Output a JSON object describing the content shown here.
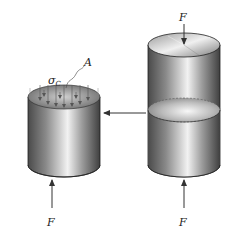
{
  "figure": {
    "labels": {
      "force_top": "F",
      "force_bottom_left": "F",
      "force_bottom_right": "F",
      "stress": "σ",
      "stress_subscript": "C",
      "area": "A"
    },
    "colors": {
      "background": "#ffffff",
      "metal_dark": "#5a5a5a",
      "metal_mid": "#9a9a9a",
      "metal_light": "#e6e6e6",
      "arrow": "#333333",
      "outline": "#222222"
    },
    "elements": [
      "left-cylinder-section",
      "right-cylinder",
      "section-arrow"
    ]
  }
}
